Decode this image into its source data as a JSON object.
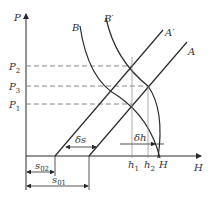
{
  "diagram": {
    "axes": {
      "y_label": "P",
      "x_label": "H"
    },
    "pressure_levels": [
      {
        "name": "P",
        "sub": "2",
        "y": 66
      },
      {
        "name": "P",
        "sub": "3",
        "y": 86
      },
      {
        "name": "P",
        "sub": "1",
        "y": 104
      }
    ],
    "lines": {
      "A": "A",
      "A_prime": "A′",
      "B": "B",
      "B_prime": "B′"
    },
    "markers": {
      "h1": {
        "name": "h",
        "sub": "1"
      },
      "h2": {
        "name": "h",
        "sub": "2"
      },
      "H_point": "H"
    },
    "dimensions": {
      "delta_s": "δs",
      "delta_h": "δh",
      "s02": {
        "name": "s",
        "sub": "02"
      },
      "s01": {
        "name": "s",
        "sub": "01"
      }
    },
    "colors": {
      "line": "#2a2a2a",
      "dashed": "#6a6a6a",
      "thin": "#8a8a8a"
    }
  }
}
